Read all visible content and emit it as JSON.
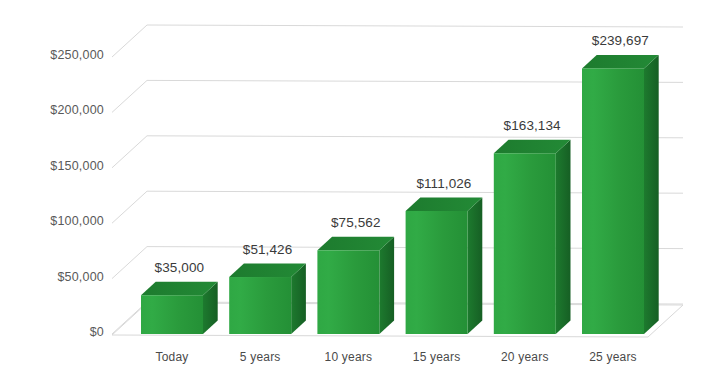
{
  "chart_data": {
    "type": "bar",
    "title": "",
    "subtitle": "",
    "xlabel": "",
    "ylabel": "",
    "categories": [
      "Today",
      "5 years",
      "10 years",
      "15 years",
      "20 years",
      "25 years"
    ],
    "values": [
      35000,
      51426,
      75562,
      111026,
      163134,
      239697
    ],
    "value_labels": [
      "$35,000",
      "$51,426",
      "$75,562",
      "$111,026",
      "$163,134",
      "$239,697"
    ],
    "ylim": [
      0,
      250000
    ],
    "ytick_values": [
      0,
      50000,
      100000,
      150000,
      200000,
      250000
    ],
    "ytick_labels": [
      "$0",
      "$50,000",
      "$100,000",
      "$150,000",
      "$200,000",
      "$250,000"
    ],
    "grid": true,
    "legend": false,
    "legend_position": "none",
    "style": "3d-column",
    "series": [
      {
        "name": "Projected balance",
        "values": [
          35000,
          51426,
          75562,
          111026,
          163134,
          239697
        ]
      }
    ],
    "colors": {
      "bar_front": "#2ba03e",
      "bar_top": "#1f7a2e",
      "bar_side": "#1b6f2a",
      "bar_edge": "#17682a",
      "gridline": "#d9d9d9",
      "floor": "#e2e2e2",
      "axis_text": "#595959",
      "label_text": "#3a3a3a",
      "background": "#ffffff"
    }
  }
}
